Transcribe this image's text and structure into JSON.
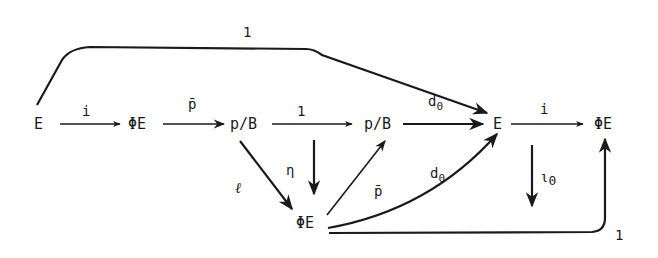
{
  "diagram": {
    "type": "commutative-diagram",
    "nodes": {
      "n1": "E",
      "n2": "ΦE",
      "n3": "p/B",
      "n4": "p/B",
      "n5": "E",
      "n6": "ΦE",
      "n7": "ΦE"
    },
    "edges": {
      "e_top": {
        "from": "E",
        "to": "E",
        "label": "1"
      },
      "e1": {
        "from": "E",
        "to": "ΦE",
        "label": "i"
      },
      "e2": {
        "from": "ΦE",
        "to": "p/B",
        "label": "p̄"
      },
      "e3": {
        "from": "p/B",
        "to": "p/B",
        "label": "1"
      },
      "e4": {
        "from": "p/B",
        "to": "E",
        "label": "d0",
        "label_main": "d",
        "label_sub": "0"
      },
      "e5": {
        "from": "E",
        "to": "ΦE",
        "label": "i"
      },
      "e_ell": {
        "from": "p/B",
        "to": "ΦE",
        "label": "ℓ"
      },
      "e_eta": {
        "from": "p/B→p/B arrow",
        "to": "ΦE",
        "label": "η"
      },
      "e_pbar2": {
        "from": "ΦE",
        "to": "p/B",
        "label": "p̄"
      },
      "e_d0b": {
        "from": "ΦE",
        "to": "E",
        "label": "d0",
        "label_main": "d",
        "label_sub": "0"
      },
      "e_iota0": {
        "from": "E→ΦE arrow",
        "to": "down",
        "label": "ι0",
        "label_main": "ι",
        "label_sub": "0"
      },
      "e_bottom": {
        "from": "ΦE",
        "to": "ΦE",
        "label": "1"
      }
    }
  }
}
